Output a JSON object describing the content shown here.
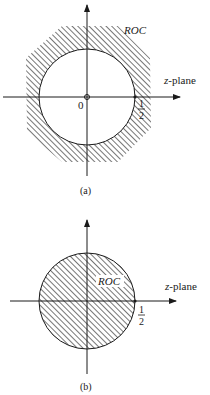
{
  "figure_a": {
    "roc_label": "ROC",
    "plane_label_var": "z",
    "plane_label_rest": "-plane",
    "origin_label": "0",
    "tick_num": "1",
    "tick_den": "2",
    "caption": "(a)",
    "region": "outside circle |z| > 1/2 (hatched)",
    "pole_marker": "o at origin"
  },
  "figure_b": {
    "roc_label": "ROC",
    "plane_label_var": "z",
    "plane_label_rest": "-plane",
    "tick_num": "1",
    "tick_den": "2",
    "caption": "(b)",
    "region": "inside circle |z| < 1/2 (hatched)"
  },
  "colors": {
    "ink": "#1a1a1a",
    "background": "#ffffff"
  }
}
